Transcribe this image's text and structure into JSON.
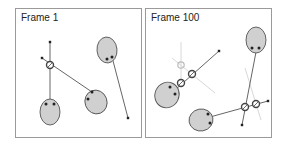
{
  "colors": {
    "ellipse_fill": "#d0d0d0",
    "ellipse_stroke": "#555555",
    "line": "#555555",
    "ghost": "#d8d8d8",
    "ring_stroke": "#444444",
    "ghost_ring": "#bbbbbb",
    "dot": "#222222",
    "border": "#9a9a9a"
  },
  "panels": [
    {
      "title": "Frame 1",
      "ellipses": [
        {
          "cx": 50,
          "cy": 112,
          "rx": 10,
          "ry": 13,
          "rot": 0,
          "dots": [
            [
              46,
              104
            ],
            [
              54,
              104
            ]
          ]
        },
        {
          "cx": 96,
          "cy": 102,
          "rx": 11,
          "ry": 12,
          "rot": -20,
          "dots": [
            [
              92,
              92
            ],
            [
              88,
              99
            ]
          ]
        },
        {
          "cx": 107,
          "cy": 50,
          "rx": 10,
          "ry": 13,
          "rot": -5,
          "dots": [
            [
              107,
              59
            ],
            [
              112,
              57
            ]
          ]
        }
      ],
      "lines": [
        {
          "x1": 50,
          "y1": 42,
          "x2": 50,
          "y2": 103
        },
        {
          "x1": 42,
          "y1": 58,
          "x2": 92,
          "y2": 92
        },
        {
          "x1": 112,
          "y1": 57,
          "x2": 128,
          "y2": 118
        }
      ],
      "ghost_lines": [],
      "rings": [
        {
          "cx": 50,
          "cy": 65
        }
      ],
      "ghost_rings": [],
      "points": [
        [
          50,
          42
        ],
        [
          42,
          58
        ],
        [
          128,
          118
        ]
      ]
    },
    {
      "title": "Frame 100",
      "ellipses": [
        {
          "cx": 167,
          "cy": 95,
          "rx": 12,
          "ry": 13,
          "rot": 25,
          "dots": [
            [
              170,
              87
            ],
            [
              175,
              94
            ]
          ]
        },
        {
          "cx": 256,
          "cy": 40,
          "rx": 10,
          "ry": 13,
          "rot": 0,
          "dots": [
            [
              252,
              48
            ],
            [
              259,
              48
            ]
          ]
        },
        {
          "cx": 201,
          "cy": 120,
          "rx": 12,
          "ry": 11,
          "rot": -10,
          "dots": [
            [
              208,
              114
            ],
            [
              210,
              123
            ]
          ]
        }
      ],
      "lines": [
        {
          "x1": 175,
          "y1": 90,
          "x2": 219,
          "y2": 51
        },
        {
          "x1": 256,
          "y1": 52,
          "x2": 242,
          "y2": 125
        },
        {
          "x1": 210,
          "y1": 117,
          "x2": 268,
          "y2": 101
        }
      ],
      "ghost_lines": [
        {
          "x1": 181,
          "y1": 42,
          "x2": 181,
          "y2": 80
        },
        {
          "x1": 172,
          "y1": 58,
          "x2": 215,
          "y2": 93
        },
        {
          "x1": 245,
          "y1": 68,
          "x2": 261,
          "y2": 120
        }
      ],
      "rings": [
        {
          "cx": 192,
          "cy": 74
        },
        {
          "cx": 181,
          "cy": 83
        },
        {
          "cx": 245,
          "cy": 107
        },
        {
          "cx": 256,
          "cy": 104
        }
      ],
      "ghost_rings": [
        {
          "cx": 181,
          "cy": 65
        }
      ],
      "points": [
        [
          219,
          51
        ],
        [
          242,
          125
        ],
        [
          268,
          101
        ]
      ]
    }
  ]
}
